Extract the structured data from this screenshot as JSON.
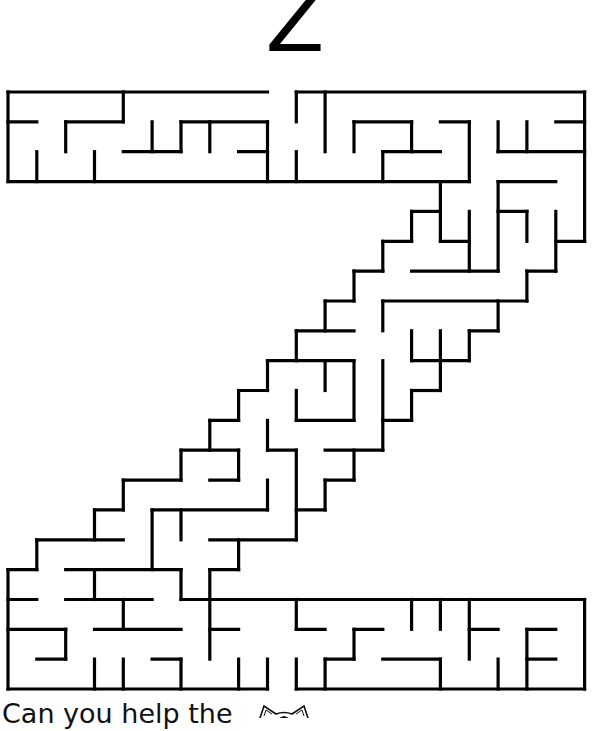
{
  "page": {
    "title_letter": "Z",
    "prompt": "Can you help the",
    "icon": "cat-face-icon"
  },
  "colors": {
    "background": "#ffffff",
    "wall": "#000000",
    "text": "#111111"
  },
  "maze": {
    "shape": "letter-Z",
    "grid": {
      "cols": 20,
      "rows": 20,
      "origin_x": 8,
      "origin_y": 92,
      "cell_w": 28.83,
      "cell_h": 29.85,
      "stroke": 3.2
    },
    "entrance": {
      "side": "top",
      "between_cols": [
        9,
        10
      ]
    },
    "exit": {
      "side": "bottom",
      "between_cols": [
        9,
        10
      ]
    },
    "h_walls": [
      [
        0,
        0,
        9
      ],
      [
        0,
        10,
        20
      ],
      [
        1,
        0,
        1
      ],
      [
        1,
        2,
        4
      ],
      [
        1,
        6,
        9
      ],
      [
        1,
        12,
        14
      ],
      [
        1,
        15,
        16
      ],
      [
        1,
        19,
        20
      ],
      [
        2,
        4,
        6
      ],
      [
        2,
        8,
        9
      ],
      [
        2,
        13,
        15
      ],
      [
        2,
        17,
        20
      ],
      [
        3,
        0,
        16
      ],
      [
        3,
        17,
        19
      ],
      [
        4,
        14,
        15
      ],
      [
        4,
        17,
        18
      ],
      [
        5,
        13,
        14
      ],
      [
        5,
        15,
        16
      ],
      [
        5,
        19,
        20
      ],
      [
        6,
        12,
        13
      ],
      [
        6,
        14,
        17
      ],
      [
        6,
        18,
        19
      ],
      [
        7,
        11,
        12
      ],
      [
        7,
        13,
        18
      ],
      [
        8,
        10,
        12
      ],
      [
        8,
        16,
        17
      ],
      [
        9,
        9,
        12
      ],
      [
        9,
        14,
        16
      ],
      [
        10,
        8,
        9
      ],
      [
        10,
        14,
        15
      ],
      [
        11,
        7,
        8
      ],
      [
        11,
        10,
        12
      ],
      [
        11,
        13,
        14
      ],
      [
        12,
        6,
        8
      ],
      [
        12,
        9,
        10
      ],
      [
        12,
        11,
        13
      ],
      [
        13,
        4,
        6
      ],
      [
        13,
        7,
        8
      ],
      [
        13,
        11,
        12
      ],
      [
        14,
        3,
        4
      ],
      [
        14,
        5,
        9
      ],
      [
        14,
        10,
        11
      ],
      [
        15,
        1,
        4
      ],
      [
        15,
        7,
        10
      ],
      [
        16,
        0,
        1
      ],
      [
        16,
        2,
        6
      ],
      [
        16,
        7,
        8
      ],
      [
        17,
        0,
        1
      ],
      [
        17,
        2,
        5
      ],
      [
        17,
        6,
        20
      ],
      [
        18,
        0,
        2
      ],
      [
        18,
        3,
        6
      ],
      [
        18,
        7,
        8
      ],
      [
        18,
        10,
        11
      ],
      [
        18,
        12,
        13
      ],
      [
        18,
        16,
        17
      ],
      [
        18,
        18,
        19
      ],
      [
        19,
        1,
        2
      ],
      [
        19,
        5,
        6
      ],
      [
        19,
        11,
        12
      ],
      [
        19,
        13,
        15
      ],
      [
        19,
        18,
        19
      ],
      [
        20,
        0,
        9
      ],
      [
        20,
        10,
        20
      ]
    ],
    "v_walls": [
      [
        0,
        0,
        3
      ],
      [
        0,
        16,
        20
      ],
      [
        1,
        2,
        3
      ],
      [
        1,
        15,
        16
      ],
      [
        2,
        1,
        2
      ],
      [
        2,
        18,
        19
      ],
      [
        3,
        2,
        3
      ],
      [
        3,
        14,
        15
      ],
      [
        3,
        16,
        17
      ],
      [
        3,
        19,
        20
      ],
      [
        4,
        0,
        1
      ],
      [
        4,
        13,
        14
      ],
      [
        4,
        17,
        18
      ],
      [
        4,
        19,
        20
      ],
      [
        5,
        1,
        2
      ],
      [
        5,
        14,
        16
      ],
      [
        6,
        1,
        2
      ],
      [
        6,
        12,
        13
      ],
      [
        6,
        14,
        15
      ],
      [
        6,
        16,
        17
      ],
      [
        6,
        19,
        20
      ],
      [
        7,
        1,
        2
      ],
      [
        7,
        11,
        12
      ],
      [
        7,
        16,
        19
      ],
      [
        8,
        10,
        11
      ],
      [
        8,
        12,
        13
      ],
      [
        8,
        15,
        16
      ],
      [
        8,
        19,
        20
      ],
      [
        9,
        1,
        3
      ],
      [
        9,
        9,
        10
      ],
      [
        9,
        11,
        12
      ],
      [
        9,
        13,
        14
      ],
      [
        9,
        19,
        20
      ],
      [
        10,
        0,
        1
      ],
      [
        10,
        2,
        3
      ],
      [
        10,
        8,
        9
      ],
      [
        10,
        10,
        11
      ],
      [
        10,
        12,
        15
      ],
      [
        10,
        17,
        18
      ],
      [
        10,
        19,
        20
      ],
      [
        11,
        0,
        2
      ],
      [
        11,
        7,
        8
      ],
      [
        11,
        9,
        10
      ],
      [
        11,
        13,
        14
      ],
      [
        11,
        19,
        20
      ],
      [
        12,
        1,
        2
      ],
      [
        12,
        6,
        7
      ],
      [
        12,
        9,
        11
      ],
      [
        12,
        12,
        13
      ],
      [
        12,
        18,
        19
      ],
      [
        13,
        2,
        3
      ],
      [
        13,
        5,
        6
      ],
      [
        13,
        7,
        8
      ],
      [
        13,
        9,
        12
      ],
      [
        14,
        1,
        2
      ],
      [
        14,
        4,
        5
      ],
      [
        14,
        8,
        9
      ],
      [
        14,
        10,
        11
      ],
      [
        14,
        17,
        18
      ],
      [
        15,
        3,
        5
      ],
      [
        15,
        8,
        10
      ],
      [
        15,
        17,
        18
      ],
      [
        15,
        19,
        20
      ],
      [
        16,
        1,
        3
      ],
      [
        16,
        4,
        6
      ],
      [
        16,
        8,
        9
      ],
      [
        16,
        17,
        19
      ],
      [
        17,
        1,
        2
      ],
      [
        17,
        3,
        6
      ],
      [
        17,
        7,
        8
      ],
      [
        17,
        19,
        20
      ],
      [
        18,
        1,
        2
      ],
      [
        18,
        4,
        5
      ],
      [
        18,
        6,
        7
      ],
      [
        18,
        18,
        20
      ],
      [
        19,
        4,
        6
      ],
      [
        20,
        0,
        5
      ],
      [
        20,
        17,
        20
      ]
    ]
  }
}
